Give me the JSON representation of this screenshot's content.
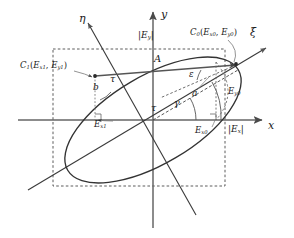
{
  "figure": {
    "kind": "polarization-ellipse-diagram",
    "stroke_color": "#3a3a3a",
    "axis_color": "#555555",
    "dashed_color": "#4a4a4a",
    "background": "#ffffff"
  },
  "axes": {
    "x": {
      "label": "x",
      "label_x": 268,
      "label_y": 125
    },
    "y": {
      "label": "y",
      "label_x": 161,
      "label_y": 12
    },
    "xi": {
      "label": "ξ",
      "label_x": 252,
      "label_y": 33
    },
    "eta": {
      "label": "η",
      "label_x": 80,
      "label_y": 19
    }
  },
  "points": {
    "c0": {
      "name": "C",
      "index": "0",
      "coord_x": "E",
      "coord_x_sub": "x0",
      "coord_y": "E",
      "coord_y_sub": "y0",
      "full": "C0(Ex0, Ey0)",
      "label_x": 192,
      "label_y": 33
    },
    "c1": {
      "name": "C",
      "index": "1",
      "coord_x": "E",
      "coord_x_sub": "x1",
      "coord_y": "E",
      "coord_y_sub": "y1",
      "full": "C1(Ex1, Ey1)",
      "label_x": 22,
      "label_y": 66
    }
  },
  "projections": {
    "ex_abs": {
      "base": "E",
      "sub": "x",
      "text": "|Ex|",
      "label_x": 228,
      "label_y": 130
    },
    "ey_abs": {
      "base": "E",
      "sub": "y",
      "text": "|Ey|",
      "label_x": 139,
      "label_y": 36
    },
    "ex0": {
      "base": "E",
      "sub": "x0",
      "label_x": 196,
      "label_y": 131
    },
    "ex1": {
      "base": "E",
      "sub": "x1",
      "label_x": 97,
      "label_y": 124
    },
    "ey0": {
      "base": "E",
      "sub": "y0",
      "label_x": 229,
      "label_y": 92
    }
  },
  "semi_axes": {
    "a": {
      "label": "a",
      "label_x": 193,
      "label_y": 94
    },
    "b": {
      "label": "b",
      "label_x": 94,
      "label_y": 88
    },
    "chord": {
      "label": "A",
      "label_x": 155,
      "label_y": 59
    }
  },
  "angles": {
    "tau_upper": {
      "label": "τ",
      "label_x": 110,
      "label_y": 79
    },
    "tau_center": {
      "label": "τ",
      "label_x": 152,
      "label_y": 108
    },
    "gamma": {
      "label": "γ",
      "label_x": 175,
      "label_y": 103
    },
    "epsilon": {
      "label": "ε",
      "label_x": 189,
      "label_y": 74
    }
  }
}
